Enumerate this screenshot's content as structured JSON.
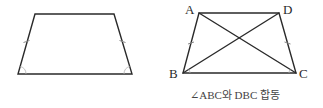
{
  "figures": {
    "left": {
      "type": "isosceles-trapezoid",
      "vertices": {
        "top_left": [
          35,
          14
        ],
        "top_right": [
          114,
          14
        ],
        "bottom_right": [
          132,
          74
        ],
        "bottom_left": [
          18,
          74
        ]
      },
      "markings": {
        "equal_side_ticks": [
          "left-leg",
          "right-leg"
        ],
        "equal_angle_arcs": [
          "bottom-left",
          "bottom-right"
        ]
      }
    },
    "right": {
      "type": "isosceles-trapezoid-with-diagonals",
      "labels": {
        "A": "A",
        "B": "B",
        "C": "C",
        "D": "D"
      },
      "vertices": {
        "A": [
          199,
          13
        ],
        "D": [
          279,
          13
        ],
        "C": [
          296,
          73
        ],
        "B": [
          183,
          73
        ]
      },
      "diagonals": [
        "AC",
        "BD"
      ],
      "markings": {
        "equal_side_ticks": [
          "AB",
          "DC"
        ]
      },
      "caption": "∠ABC와 DBC 합동"
    }
  },
  "colors": {
    "line": "#2a2a2a",
    "tick": "#8a8a8a",
    "background": "#ffffff"
  }
}
